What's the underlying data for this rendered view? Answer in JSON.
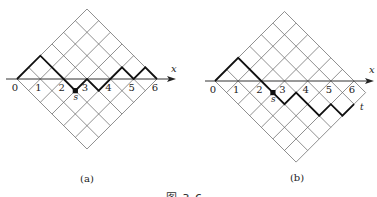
{
  "figure": {
    "caption": "图 3.6",
    "panels": [
      {
        "id": "a",
        "label": "(a)",
        "label_pos": [
          87,
          182
        ],
        "origin": [
          17,
          79
        ],
        "unit": 23.33,
        "grid": {
          "cells_up": 6,
          "cells_down": 6
        },
        "axis": {
          "x_from": 6,
          "x_to": 176,
          "label": "x",
          "label_pos": [
            171,
            72
          ]
        },
        "ticks": [
          "0",
          "1",
          "2",
          "3",
          "4",
          "5",
          "6"
        ],
        "path_heights": [
          0,
          2,
          0,
          -1,
          0,
          -1,
          0,
          1,
          0,
          1,
          0
        ],
        "path_x_halfsteps": [
          0,
          2,
          4,
          5,
          6,
          7,
          8,
          9,
          10,
          11,
          12
        ],
        "points": [
          {
            "name": "s",
            "label": "s",
            "x_halfstep": 5,
            "h": -1
          }
        ],
        "end_label": null
      },
      {
        "id": "b",
        "label": "(b)",
        "label_pos": [
          297,
          181
        ],
        "origin": [
          215,
          81
        ],
        "unit": 23.17,
        "grid": {
          "cells_up": 6,
          "cells_down": 7
        },
        "axis": {
          "x_from": 205,
          "x_to": 374,
          "label": "x",
          "label_pos": [
            369,
            73
          ]
        },
        "ticks": [
          "0",
          "1",
          "2",
          "3",
          "4",
          "5",
          "6"
        ],
        "path_heights": [
          0,
          2,
          0,
          -1,
          -2,
          -1,
          -3,
          -2,
          -3,
          -2
        ],
        "path_x_halfsteps": [
          0,
          2,
          4,
          5,
          6,
          7,
          9,
          10,
          11,
          12
        ],
        "points": [
          {
            "name": "s",
            "label": "s",
            "x_halfstep": 5,
            "h": -1
          }
        ],
        "end_label": {
          "label": "t",
          "dx": 6,
          "dy": 6
        }
      }
    ]
  }
}
